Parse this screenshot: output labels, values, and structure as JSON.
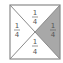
{
  "diagram": {
    "type": "square-divided-into-quarters-by-diagonals",
    "colors": {
      "border": "#8a8a8a",
      "shaded": "#a8a8a8",
      "background": "#ffffff",
      "text": "#555555"
    },
    "regions": [
      {
        "position": "top",
        "numerator": "1",
        "denominator": "4",
        "shaded": false
      },
      {
        "position": "left",
        "numerator": "1",
        "denominator": "4",
        "shaded": false
      },
      {
        "position": "right",
        "numerator": "1",
        "denominator": "4",
        "shaded": true
      },
      {
        "position": "bottom",
        "numerator": "1",
        "denominator": "4",
        "shaded": false
      }
    ]
  }
}
